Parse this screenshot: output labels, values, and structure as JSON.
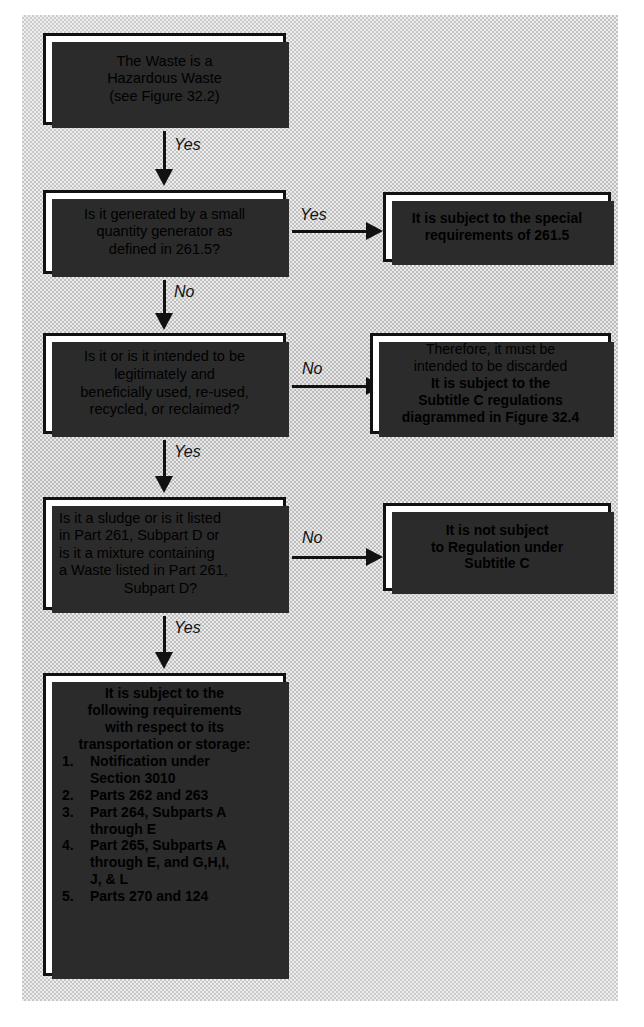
{
  "figure": {
    "background_color": "#e8e8e8",
    "box_fill": "#ffffff",
    "line_color": "#111111"
  },
  "nodes": {
    "start": {
      "lines": [
        "The Waste is a",
        "Hazardous Waste",
        "(see Figure 32.2)"
      ]
    },
    "q1": {
      "lines": [
        "Is it generated by a small",
        "quantity generator as",
        "defined in 261.5?"
      ]
    },
    "r1": {
      "lines": [
        "It is subject to the special",
        "requirements of  261.5"
      ]
    },
    "q2": {
      "lines": [
        "Is it or is it intended to be",
        "legitimately and",
        "beneficially used, re-used,",
        "recycled, or reclaimed?"
      ]
    },
    "r2": {
      "lines_regular": [
        "Therefore, it must be",
        "intended to be discarded"
      ],
      "lines_bold": [
        "It is subject to the",
        "Subtitle C regulations",
        "diagrammed in Figure 32.4"
      ]
    },
    "q3": {
      "lines": [
        "Is it a sludge or is it listed",
        "in Part 261, Subpart D or",
        "is it a mixture containing",
        "a Waste listed in Part 261,"
      ],
      "last_line_centered": "Subpart D?"
    },
    "r3": {
      "lines": [
        "It is not subject",
        "to Regulation under",
        "Subtitle C"
      ]
    },
    "final": {
      "head_lines": [
        "It is subject to the",
        "following requirements",
        "with respect to its",
        "transportation or storage:"
      ],
      "items": [
        {
          "num": "1.",
          "lines": [
            "Notification under",
            "Section 3010"
          ]
        },
        {
          "num": "2.",
          "lines": [
            "Parts 262 and 263"
          ]
        },
        {
          "num": "3.",
          "lines": [
            "Part 264, Subparts A",
            "through E"
          ]
        },
        {
          "num": "4.",
          "lines": [
            "Part 265, Subparts A",
            "through E, and G,H,I,",
            "J, & L"
          ]
        },
        {
          "num": "5.",
          "lines": [
            "Parts 270 and 124"
          ]
        }
      ]
    }
  },
  "edges": {
    "start_to_q1": "Yes",
    "q1_to_r1": "Yes",
    "q1_to_q2": "No",
    "q2_to_r2": "No",
    "q2_to_q3": "Yes",
    "q3_to_r3": "No",
    "q3_to_final": "Yes"
  }
}
